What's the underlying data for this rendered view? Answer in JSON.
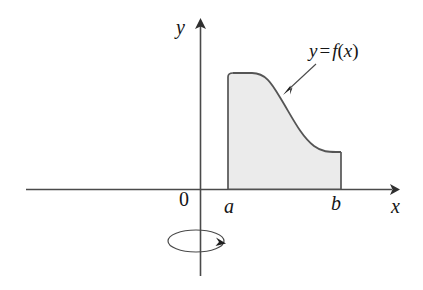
{
  "figure": {
    "background_color": "#ffffff",
    "stroke_color": "#3a3a3a",
    "axis_color": "#4a4a4a",
    "region_fill_color": "#ebebeb",
    "region_stroke_color": "#555555",
    "label_color": "#151515"
  },
  "axes": {
    "x_axis": {
      "label": "x",
      "icon": "arrow-right-icon",
      "start_px": 26,
      "end_px": 397,
      "y_px": 189
    },
    "y_axis": {
      "label": "y",
      "icon": "arrow-up-icon",
      "x_px": 200,
      "top_px": 20,
      "bottom_px": 276
    },
    "origin_label": "0"
  },
  "region": {
    "name": "shaded-region",
    "left_bound_label": "a",
    "right_bound_label": "b",
    "left_bound_px": 228,
    "right_bound_px": 342,
    "baseline_px": 189,
    "top_left_px": 73,
    "top_right_px": 152
  },
  "curve": {
    "name": "function-curve",
    "annotation": {
      "y": "y",
      "equals": "=",
      "f": "f",
      "open_paren": "(",
      "x": "x",
      "close_paren": ")",
      "full_text": "y = f(x)"
    },
    "pointer": {
      "icon": "arrow-pointer-icon",
      "from_px": [
        316,
        64
      ],
      "to_px": [
        284,
        94
      ]
    }
  },
  "revolution": {
    "name": "revolution-indicator",
    "icon": "rotation-ellipse-icon",
    "center_px": [
      196,
      241
    ],
    "radius_x_px": 28,
    "radius_y_px": 11,
    "arrow_icon": "arrow-head-icon"
  }
}
